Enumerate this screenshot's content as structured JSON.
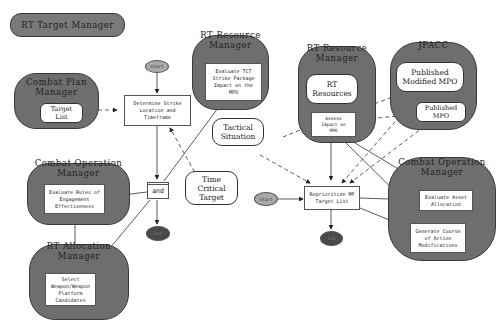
{
  "diagram": {
    "title": "RT Target Manager",
    "managers": {
      "combat_plan": {
        "title": "Combat Plan\nManager",
        "items": [
          {
            "label": "Target\nList",
            "kind": "data"
          }
        ]
      },
      "rt_resource_1": {
        "title": "RT Resource\nManager",
        "items": [
          {
            "label": "Evaluate TCT\nStrike Package\nImpact on the\nMPO",
            "kind": "activity"
          }
        ]
      },
      "rt_resource_2": {
        "title": "RT Resource\nManager",
        "items": [
          {
            "label": "RT\nResources",
            "kind": "data"
          },
          {
            "label": "Assess\nImpact on\nMPO",
            "kind": "activity"
          }
        ]
      },
      "jfacc": {
        "title": "JFACC",
        "items": [
          {
            "label": "Published\nModified MPO",
            "kind": "data"
          },
          {
            "label": "Published\nMPO",
            "kind": "data"
          }
        ]
      },
      "combat_operation_1": {
        "title": "Combat Operation\nManager",
        "items": [
          {
            "label": "Evaluate Rules of\nEngagement\nEffectiveness",
            "kind": "activity"
          }
        ]
      },
      "rt_allocation": {
        "title": "RT Allocation\nManager",
        "items": [
          {
            "label": "Select\nWeapon/Weapon\nPlatform\nCandidates",
            "kind": "activity"
          }
        ]
      },
      "combat_operation_2": {
        "title": "Combat Operation\nManager",
        "items": [
          {
            "label": "Evaluate Asset\nAllocation",
            "kind": "activity"
          },
          {
            "label": "Generate Course\nof Action\nModifications",
            "kind": "activity"
          }
        ]
      }
    },
    "free_nodes": {
      "determine": "Determine Strike\nLocation and\nTimeframe",
      "and": "and",
      "tactical_situation": "Tactical\nSituation",
      "time_critical_target": "Time\nCritical\nTarget",
      "reprioritize": "Reprioritize MP\nTarget List",
      "start": "Start",
      "end": "End"
    },
    "colors": {
      "manager_fill": "#6e6e6e",
      "start_fill": "#a9a9a9",
      "end_fill": "#4a4a4a",
      "box_fill": "#ffffff",
      "line": "#333333"
    }
  }
}
